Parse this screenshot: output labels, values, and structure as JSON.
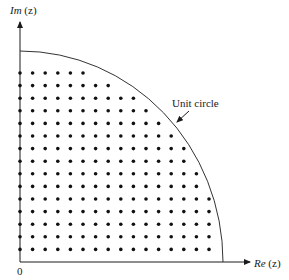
{
  "labels": {
    "im_axis_prefix": "Im",
    "im_axis_arg": " (z)",
    "re_axis_prefix": "Re",
    "re_axis_arg": " (z)",
    "origin": "0",
    "unit_circle": "Unit circle"
  },
  "colors": {
    "ink": "#1a1a1a",
    "background": "#ffffff"
  },
  "grid": {
    "origin_px": [
      20,
      262
    ],
    "spacing_px": 12.6,
    "first_row_y_px": 73,
    "row_dot_counts_top_to_bottom": [
      6,
      8,
      10,
      11,
      12,
      13,
      14,
      14,
      15,
      15,
      16,
      16,
      16,
      16,
      16
    ]
  },
  "chart_data": {
    "type": "scatter",
    "title": "",
    "xlabel": "Re (z)",
    "ylabel": "Im (z)",
    "annotations": [
      "Unit circle",
      "0"
    ],
    "grid_rows": 15,
    "max_columns": 16,
    "row_point_counts_top_to_bottom": [
      6,
      8,
      10,
      11,
      12,
      13,
      14,
      14,
      15,
      15,
      16,
      16,
      16,
      16,
      16
    ],
    "total_points": 208
  }
}
